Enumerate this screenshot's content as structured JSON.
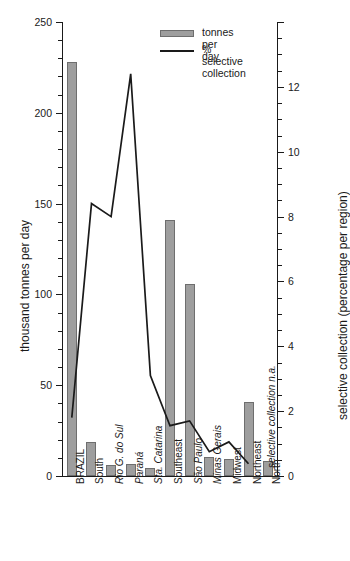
{
  "chart_data": {
    "type": "bar",
    "title": "",
    "categories": [
      "BRAZIL",
      "South",
      "Rio G. do Sul",
      "Paraná",
      "Sta. Catarina",
      "Southeast",
      "São Paulo",
      "Minas Gerais",
      "Midwest",
      "Northeast",
      "North"
    ],
    "series": [
      {
        "name": "tonnes per day",
        "type": "bar",
        "axis": "left",
        "values": [
          228,
          19,
          6,
          6.5,
          4.5,
          141,
          106,
          10.5,
          9.5,
          41,
          8
        ]
      },
      {
        "name": "% selective collection",
        "type": "line",
        "axis": "right",
        "values": [
          1.8,
          8.4,
          8.0,
          12.4,
          3.1,
          1.55,
          1.7,
          0.75,
          1.05,
          0.38,
          null
        ]
      }
    ],
    "ylabel": "thousand tonnes per day",
    "ylabel_right": "selective collection (percentage per region)",
    "xlabel": "",
    "ylim": [
      0,
      250
    ],
    "ylim_right": [
      0,
      14
    ],
    "yticks_left": [
      0,
      50,
      100,
      150,
      200,
      250
    ],
    "yticks_left_labels": [
      "0",
      "50",
      "100",
      "150",
      "200",
      "250"
    ],
    "yticks_right": [
      0,
      2,
      4,
      6,
      8,
      10,
      12
    ],
    "yticks_right_labels": [
      "0",
      "2",
      "4",
      "6",
      "8",
      "10",
      "12"
    ],
    "grid": false,
    "legend_position": "top-right",
    "annotation": "selective collection n.a."
  },
  "legend": {
    "entries": [
      {
        "label": "tonnes per day",
        "marker": "bar-swatch",
        "color": "#9e9e9e"
      },
      {
        "label": "% selective\ncollection",
        "marker": "line-swatch",
        "color": "#1a1a1a"
      }
    ]
  },
  "colors": {
    "bar_fill": "#9e9e9e",
    "bar_edge": "#6e6e6e",
    "line": "#1a1a1a",
    "axis": "#1a1a1a",
    "background": "#ffffff"
  },
  "axes": {
    "left_title": "thousand tonnes per day",
    "right_title": "selective collection (percentage per region)",
    "left_ticks": [
      "250",
      "200",
      "150",
      "100",
      "50",
      "0"
    ],
    "right_ticks": [
      "12",
      "10",
      "8",
      "6",
      "4",
      "2",
      "0"
    ]
  },
  "annotation": {
    "text": "selective collection n.a."
  }
}
